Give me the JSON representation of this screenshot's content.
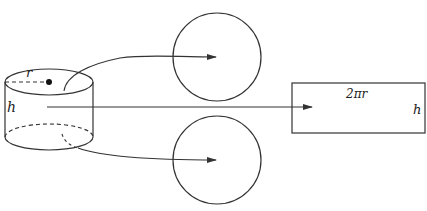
{
  "diagram": {
    "stroke_color": "#333333",
    "background": "#ffffff",
    "labels": {
      "radius": "r",
      "height_cylinder": "h",
      "rect_width": "2πr",
      "rect_height": "h"
    },
    "parts": [
      {
        "id": "cylinder",
        "description": "Cylinder with radius r and height h"
      },
      {
        "id": "top-circle",
        "description": "Top circular face"
      },
      {
        "id": "bottom-circle",
        "description": "Bottom circular face"
      },
      {
        "id": "lateral-rectangle",
        "description": "Unrolled lateral surface, width 2πr, height h"
      }
    ],
    "arrows": [
      {
        "from": "cylinder-top",
        "to": "top-circle"
      },
      {
        "from": "cylinder-side",
        "to": "lateral-rectangle"
      },
      {
        "from": "cylinder-bottom",
        "to": "bottom-circle"
      }
    ]
  }
}
